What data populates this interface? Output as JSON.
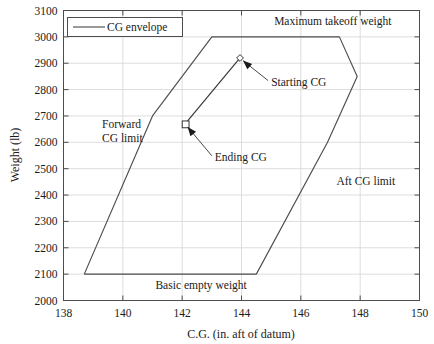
{
  "chart_data": {
    "type": "line",
    "title": "",
    "xlabel": "C.G. (in. aft of datum)",
    "ylabel": "Weight (lb)",
    "xlim": [
      138,
      150
    ],
    "ylim": [
      2000,
      3100
    ],
    "xticks": [
      138,
      140,
      142,
      144,
      146,
      148,
      150
    ],
    "yticks": [
      2000,
      2100,
      2200,
      2300,
      2400,
      2500,
      2600,
      2700,
      2800,
      2900,
      3000,
      3100
    ],
    "grid": true,
    "legend": {
      "position": "upper-left-inside",
      "entries": [
        {
          "label": "CG envelope",
          "marker": "line",
          "color": "#4d4d4d"
        }
      ]
    },
    "series": [
      {
        "name": "CG envelope",
        "type": "closed-polygon",
        "color": "#4d4d4d",
        "points": [
          [
            138.7,
            2100
          ],
          [
            141.0,
            2700
          ],
          [
            143.0,
            3000
          ],
          [
            147.3,
            3000
          ],
          [
            147.9,
            2850
          ],
          [
            146.9,
            2600
          ],
          [
            144.5,
            2100
          ],
          [
            138.7,
            2100
          ]
        ]
      },
      {
        "name": "CG travel",
        "type": "line-with-markers",
        "color": "#333333",
        "points": [
          {
            "x": 143.95,
            "y": 2920,
            "marker": "diamond",
            "label": "Starting CG"
          },
          {
            "x": 142.1,
            "y": 2670,
            "marker": "square",
            "label": "Ending CG"
          }
        ]
      }
    ],
    "annotations": [
      {
        "text": "Maximum takeoff weight",
        "x": 145.1,
        "y": 3045,
        "arrow": false
      },
      {
        "text": "Forward",
        "x": 139.3,
        "y": 2655,
        "arrow": false
      },
      {
        "text": "CG limit",
        "x": 139.3,
        "y": 2600,
        "arrow": false
      },
      {
        "text": "Aft CG limit",
        "x": 147.2,
        "y": 2440,
        "arrow": false
      },
      {
        "text": "Basic empty weight",
        "x": 141.1,
        "y": 2043,
        "arrow": false
      },
      {
        "text": "Starting CG",
        "x": 145.0,
        "y": 2815,
        "arrow": true,
        "arrow_to": [
          143.95,
          2920
        ]
      },
      {
        "text": "Ending CG",
        "x": 143.1,
        "y": 2530,
        "arrow": true,
        "arrow_to": [
          142.1,
          2670
        ]
      }
    ]
  },
  "axes": {
    "x_tick_labels": [
      "138",
      "140",
      "142",
      "144",
      "146",
      "148",
      "150"
    ],
    "y_tick_labels": [
      "2000",
      "2100",
      "2200",
      "2300",
      "2400",
      "2500",
      "2600",
      "2700",
      "2800",
      "2900",
      "3000",
      "3100"
    ],
    "x_axis_title": "C.G. (in. aft of datum)",
    "y_axis_title": "Weight (lb)"
  },
  "legend": {
    "entry_label": "CG envelope"
  },
  "colors": {
    "envelope_line": "#4d4d4d",
    "travel_line": "#333333",
    "grid": "#d9d9d9",
    "axis": "#4d4d4d",
    "text": "#1a1a1a",
    "background": "#ffffff"
  }
}
